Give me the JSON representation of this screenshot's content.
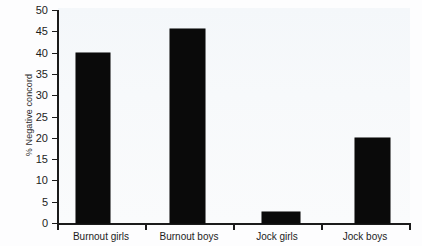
{
  "chart_data": {
    "type": "bar",
    "title": "",
    "xlabel": "",
    "ylabel": "% Negative concord",
    "categories": [
      "Burnout girls",
      "Burnout boys",
      "Jock girls",
      "Jock boys"
    ],
    "values": [
      40,
      45.5,
      2.5,
      20
    ],
    "ylim": [
      0,
      50
    ],
    "yticks": [
      0,
      5,
      10,
      15,
      20,
      25,
      30,
      35,
      40,
      45,
      50
    ],
    "ytick_labels": [
      "0",
      "5",
      "10",
      "15",
      "20",
      "25",
      "30",
      "35",
      "40",
      "45",
      "50"
    ],
    "grid": false,
    "legend": null,
    "bar_color": "#0a0a0a",
    "axis_color": "#1b1b1b"
  }
}
